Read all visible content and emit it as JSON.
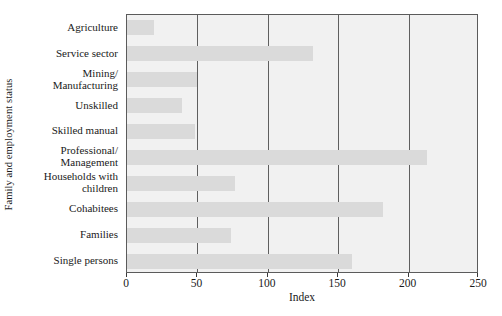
{
  "chart_data": {
    "type": "bar",
    "orientation": "horizontal",
    "title": "",
    "xlabel": "Index",
    "ylabel": "Family and employment status",
    "xlim": [
      0,
      250
    ],
    "xticks": [
      0,
      50,
      100,
      150,
      200,
      250
    ],
    "gridlines": [
      50,
      100,
      150,
      200
    ],
    "grid": true,
    "legend": null,
    "categories": [
      "Agriculture",
      "Service sector",
      "Mining/\nManufacturing",
      "Unskilled",
      "Skilled manual",
      "Professional/\nManagement",
      "Households with\nchildren",
      "Cohabitees",
      "Families",
      "Single persons"
    ],
    "values": [
      19,
      132,
      50,
      39,
      48,
      213,
      77,
      182,
      74,
      160
    ],
    "colors": {
      "bar": "#dadada",
      "plot_background": "#f1f1f1",
      "axis": "#5b5b5b",
      "gridline": "#5f5f5f",
      "text": "#1a1a1a",
      "figure_background": "#ffffff"
    }
  }
}
